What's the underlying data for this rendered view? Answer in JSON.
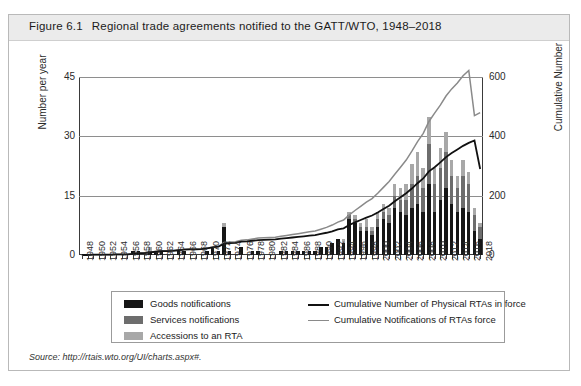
{
  "figure": {
    "number": "Figure 6.1",
    "title": "Regional trade agreements notified to the GATT/WTO, 1948–2018",
    "source_prefix": "Source:",
    "source_url": "http://rtais.wto.org/UI/charts.aspx#."
  },
  "axes": {
    "left_label": "Number per year",
    "right_label": "Cumulative Number",
    "left_ticks": [
      "0",
      "15",
      "30",
      "45"
    ],
    "right_ticks": [
      "0",
      "200",
      "400",
      "600"
    ]
  },
  "legend": {
    "items": [
      {
        "label": "Goods notifications",
        "type": "swatch",
        "color": "#161616"
      },
      {
        "label": "Services notifications",
        "type": "swatch",
        "color": "#6d6d6d"
      },
      {
        "label": "Accessions to an RTA",
        "type": "swatch",
        "color": "#a8a8a8"
      },
      {
        "label": "Cumulative Number of Physical RTAs in force",
        "type": "line",
        "color": "#111111"
      },
      {
        "label": "Cumulative Notifications of RTAs force",
        "type": "line",
        "color": "#8a8a8a"
      }
    ]
  },
  "chart_data": {
    "type": "bar",
    "title": "Regional trade agreements notified to the GATT/WTO, 1948–2018",
    "xlabel": "",
    "ylabel": "Number per year",
    "y2label": "Cumulative Number",
    "ylim": [
      0,
      45
    ],
    "y2lim": [
      0,
      600
    ],
    "grid": true,
    "legend_position": "bottom",
    "stacked": true,
    "x": [
      1948,
      1949,
      1950,
      1951,
      1952,
      1953,
      1954,
      1955,
      1956,
      1957,
      1958,
      1959,
      1960,
      1961,
      1962,
      1963,
      1964,
      1965,
      1966,
      1967,
      1968,
      1969,
      1970,
      1971,
      1972,
      1973,
      1974,
      1975,
      1976,
      1977,
      1978,
      1979,
      1980,
      1981,
      1982,
      1983,
      1984,
      1985,
      1986,
      1987,
      1988,
      1989,
      1990,
      1991,
      1992,
      1993,
      1994,
      1995,
      1996,
      1997,
      1998,
      1999,
      2000,
      2001,
      2002,
      2003,
      2004,
      2005,
      2006,
      2007,
      2008,
      2009,
      2010,
      2011,
      2012,
      2013,
      2014,
      2015,
      2016,
      2017,
      2018
    ],
    "tick_labels": [
      "1948",
      "1950",
      "1952",
      "1954",
      "1956",
      "1958",
      "1960",
      "1962",
      "1964",
      "1966",
      "1968",
      "1970",
      "1972",
      "1974",
      "1976",
      "1978",
      "1980",
      "1982",
      "1984",
      "1986",
      "1988",
      "1990",
      "1992",
      "1994",
      "1996",
      "1998",
      "2000",
      "2002",
      "2004",
      "2006",
      "2008",
      "2010",
      "2012",
      "2014",
      "2016",
      "2018"
    ],
    "series": [
      {
        "name": "Goods notifications",
        "color": "#161616",
        "values": [
          0,
          0,
          0,
          0,
          0,
          0,
          0,
          0,
          0,
          1,
          1,
          0,
          1,
          1,
          1,
          0,
          0,
          1,
          1,
          0,
          0,
          0,
          1,
          2,
          1,
          7,
          1,
          0,
          2,
          0,
          1,
          1,
          0,
          0,
          0,
          1,
          1,
          1,
          1,
          1,
          1,
          1,
          2,
          2,
          3,
          4,
          3,
          9,
          8,
          6,
          6,
          5,
          7,
          9,
          8,
          12,
          11,
          10,
          12,
          13,
          11,
          18,
          11,
          14,
          17,
          13,
          11,
          12,
          11,
          6,
          4
        ]
      },
      {
        "name": "Services notifications",
        "color": "#6d6d6d",
        "values": [
          0,
          0,
          0,
          0,
          0,
          0,
          0,
          0,
          0,
          0,
          0,
          0,
          0,
          0,
          0,
          0,
          0,
          0,
          0,
          0,
          0,
          0,
          0,
          0,
          0,
          0,
          0,
          0,
          0,
          0,
          0,
          0,
          0,
          0,
          0,
          0,
          0,
          0,
          0,
          0,
          0,
          0,
          0,
          0,
          0,
          0,
          0,
          1,
          1,
          1,
          1,
          1,
          2,
          2,
          2,
          3,
          3,
          4,
          6,
          7,
          6,
          10,
          7,
          8,
          9,
          7,
          6,
          8,
          7,
          4,
          3
        ]
      },
      {
        "name": "Accessions to an RTA",
        "color": "#a8a8a8",
        "values": [
          0,
          0,
          0,
          0,
          0,
          0,
          0,
          0,
          0,
          0,
          0,
          0,
          1,
          0,
          0,
          0,
          0,
          0,
          0,
          0,
          0,
          0,
          0,
          0,
          0,
          1,
          0,
          0,
          0,
          0,
          0,
          0,
          0,
          0,
          0,
          0,
          0,
          0,
          0,
          0,
          0,
          0,
          0,
          0,
          0,
          0,
          1,
          1,
          1,
          1,
          2,
          1,
          2,
          2,
          2,
          3,
          3,
          4,
          5,
          6,
          5,
          7,
          4,
          5,
          5,
          4,
          3,
          4,
          3,
          2,
          1
        ]
      }
    ],
    "lines": [
      {
        "name": "Cumulative Number of Physical RTAs in force",
        "color": "#111111",
        "axis": "right",
        "values": [
          0,
          0,
          1,
          1,
          1,
          1,
          2,
          2,
          2,
          4,
          6,
          6,
          9,
          11,
          13,
          13,
          14,
          16,
          18,
          19,
          19,
          20,
          22,
          26,
          28,
          38,
          40,
          41,
          45,
          46,
          48,
          50,
          51,
          52,
          53,
          55,
          57,
          59,
          61,
          63,
          65,
          67,
          71,
          75,
          80,
          86,
          90,
          101,
          110,
          118,
          126,
          133,
          143,
          155,
          166,
          181,
          195,
          208,
          224,
          242,
          258,
          282,
          296,
          312,
          330,
          344,
          356,
          368,
          378,
          386,
          290
        ]
      },
      {
        "name": "Cumulative Notifications of RTAs force",
        "color": "#8a8a8a",
        "axis": "right",
        "values": [
          0,
          0,
          1,
          1,
          1,
          1,
          2,
          2,
          2,
          4,
          6,
          6,
          10,
          12,
          14,
          14,
          15,
          17,
          19,
          20,
          20,
          21,
          23,
          27,
          29,
          42,
          44,
          45,
          50,
          51,
          54,
          57,
          58,
          59,
          60,
          63,
          66,
          69,
          72,
          75,
          78,
          81,
          87,
          93,
          101,
          111,
          118,
          135,
          150,
          164,
          178,
          190,
          208,
          228,
          248,
          272,
          296,
          320,
          350,
          382,
          410,
          450,
          478,
          505,
          536,
          560,
          580,
          604,
          622,
          470,
          480
        ]
      }
    ],
    "peak_note": {
      "year": 2009,
      "total": 35
    }
  }
}
